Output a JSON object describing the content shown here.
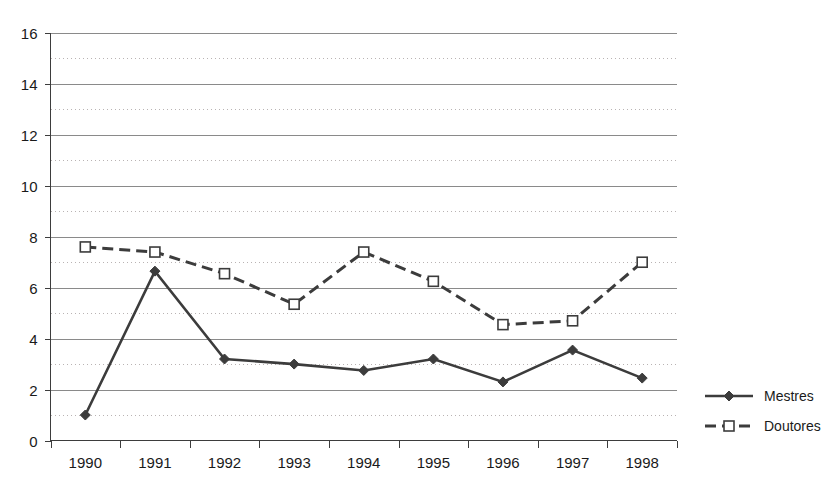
{
  "chart_data": {
    "type": "line",
    "title": "",
    "subtitle": "",
    "xlabel": "",
    "ylabel": "",
    "categories": [
      "1990",
      "1991",
      "1992",
      "1993",
      "1994",
      "1995",
      "1996",
      "1997",
      "1998"
    ],
    "series": [
      {
        "name": "Mestres",
        "marker": "filled-diamond",
        "line_style": "solid",
        "color": "#3c3c3c",
        "values": [
          1.0,
          6.65,
          3.2,
          3.0,
          2.75,
          3.2,
          2.3,
          3.55,
          2.45
        ]
      },
      {
        "name": "Doutores",
        "marker": "open-square",
        "line_style": "dashed",
        "color": "#3c3c3c",
        "values": [
          7.6,
          7.4,
          6.55,
          5.35,
          7.4,
          6.25,
          4.55,
          4.7,
          7.0
        ]
      }
    ],
    "ylim": [
      0,
      16
    ],
    "y_ticks": [
      0,
      2,
      4,
      6,
      8,
      10,
      12,
      14,
      16
    ],
    "y_tick_labels": [
      "0",
      "2",
      "4",
      "6",
      "8",
      "10",
      "12",
      "14",
      "16"
    ],
    "y_minor_gridlines": [
      1,
      3,
      5,
      7,
      9,
      11,
      13,
      15
    ],
    "grid": "major-solid-minor-dotted",
    "legend_position": "right",
    "legend": [
      "Mestres",
      "Doutores"
    ]
  },
  "colors": {
    "background": "#ffffff",
    "axis": "#3d3d3d",
    "grid_major": "#8a8a8a",
    "grid_minor": "#b9b3b3",
    "series": "#3c3c3c",
    "text": "#1a1a1a"
  }
}
